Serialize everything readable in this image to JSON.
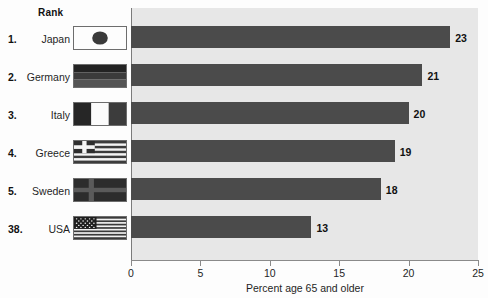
{
  "table": {
    "header": "Rank",
    "rows": [
      {
        "rank": "1.",
        "country": "Japan",
        "flag": "flag-japan"
      },
      {
        "rank": "2.",
        "country": "Germany",
        "flag": "flag-germany"
      },
      {
        "rank": "3.",
        "country": "Italy",
        "flag": "flag-italy"
      },
      {
        "rank": "4.",
        "country": "Greece",
        "flag": "flag-greece"
      },
      {
        "rank": "5.",
        "country": "Sweden",
        "flag": "flag-sweden"
      },
      {
        "rank": "38.",
        "country": "USA",
        "flag": "flag-usa"
      }
    ]
  },
  "chart_data": {
    "type": "bar",
    "orientation": "horizontal",
    "title": "",
    "xlabel": "Percent age 65 and older",
    "ylabel": "",
    "categories": [
      "Japan",
      "Germany",
      "Italy",
      "Greece",
      "Sweden",
      "USA"
    ],
    "values": [
      23,
      21,
      20,
      19,
      18,
      13
    ],
    "value_labels": [
      "23",
      "21",
      "20",
      "19",
      "18",
      "13"
    ],
    "xlim": [
      0,
      25
    ],
    "xticks": [
      0,
      5,
      10,
      15,
      20,
      25
    ],
    "xtick_labels": [
      "0",
      "5",
      "10",
      "15",
      "20",
      "25"
    ],
    "grid": false,
    "legend": false,
    "bar_color": "#4b4b4b",
    "plot_background": "#e7e7e7"
  }
}
